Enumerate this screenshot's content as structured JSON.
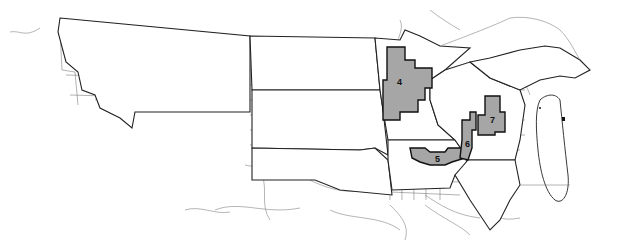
{
  "map": {
    "title": "",
    "description": "Northern-central United States county outline map with highlighted regions",
    "states_shown": [
      "Montana",
      "North Dakota",
      "South Dakota",
      "Nebraska",
      "Minnesota",
      "Iowa",
      "Wisconsin",
      "Illinois",
      "Michigan"
    ],
    "colors": {
      "background": "#ffffff",
      "region_fill": "#a6a6a6",
      "boundary": "#222222",
      "county_lines": "#555555",
      "rivers": "#777777"
    },
    "regions": [
      {
        "id": "4",
        "label": "4",
        "location": "Central Minnesota"
      },
      {
        "id": "5",
        "label": "5",
        "location": "Northern Iowa / Southern Minnesota"
      },
      {
        "id": "6",
        "label": "6",
        "location": "Western Wisconsin / Mississippi River"
      },
      {
        "id": "7",
        "label": "7",
        "location": "Central Wisconsin"
      }
    ]
  }
}
